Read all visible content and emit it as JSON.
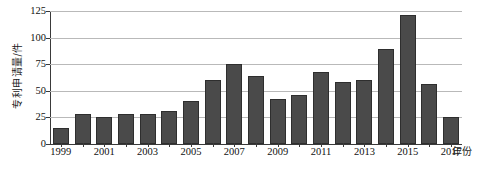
{
  "chart_data": {
    "type": "bar",
    "title": "",
    "xlabel": "年份",
    "ylabel": "专利申请量/件",
    "categories": [
      "1999",
      "2000",
      "2001",
      "2002",
      "2003",
      "2004",
      "2005",
      "2006",
      "2007",
      "2008",
      "2009",
      "2010",
      "2011",
      "2012",
      "2013",
      "2014",
      "2015",
      "2016",
      "2017"
    ],
    "values": [
      15,
      28,
      25,
      28,
      28,
      31,
      40,
      60,
      75,
      64,
      42,
      46,
      68,
      58,
      60,
      89,
      121,
      56,
      25
    ],
    "ylim": [
      0,
      125
    ],
    "yticks": [
      0,
      25,
      50,
      75,
      100,
      125
    ],
    "ytick_labels": [
      "0",
      "25",
      "50",
      "75",
      "100",
      "125"
    ],
    "xtick_labels": [
      "1999",
      "2001",
      "2003",
      "2005",
      "2007",
      "2009",
      "2011",
      "2013",
      "2015",
      "2017"
    ],
    "grid": true,
    "legend": "none",
    "bar_color": "#4a4a4a",
    "bar_edge_color": "#2e2e2e",
    "grid_color": "#b9b9b9",
    "axis_color": "#3a3a3a",
    "background_color": "#ffffff"
  }
}
